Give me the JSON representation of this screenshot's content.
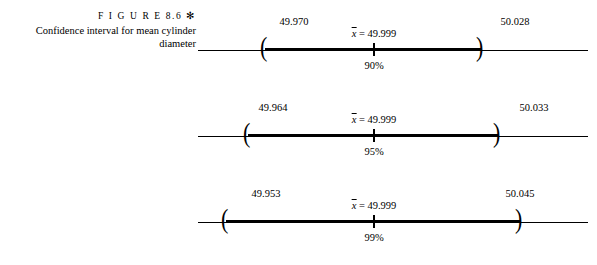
{
  "figure": {
    "label": "F I G U R E   8.6  ✻",
    "caption_line_1": "Confidence interval for mean cylinder",
    "caption_line_2": "diameter"
  },
  "intervals": [
    {
      "lower": "49.970",
      "center": "49.999",
      "center_prefix": "x̄ = ",
      "upper": "50.028",
      "level": "90%"
    },
    {
      "lower": "49.964",
      "center": "49.999",
      "center_prefix": "x̄ = ",
      "upper": "50.033",
      "level": "95%"
    },
    {
      "lower": "49.953",
      "center": "49.999",
      "center_prefix": "x̄ = ",
      "upper": "50.045",
      "level": "99%"
    }
  ],
  "glyphs": {
    "left_paren": "(",
    "right_paren": ")"
  },
  "colors": {
    "ink": "#000000",
    "background": "#ffffff"
  }
}
